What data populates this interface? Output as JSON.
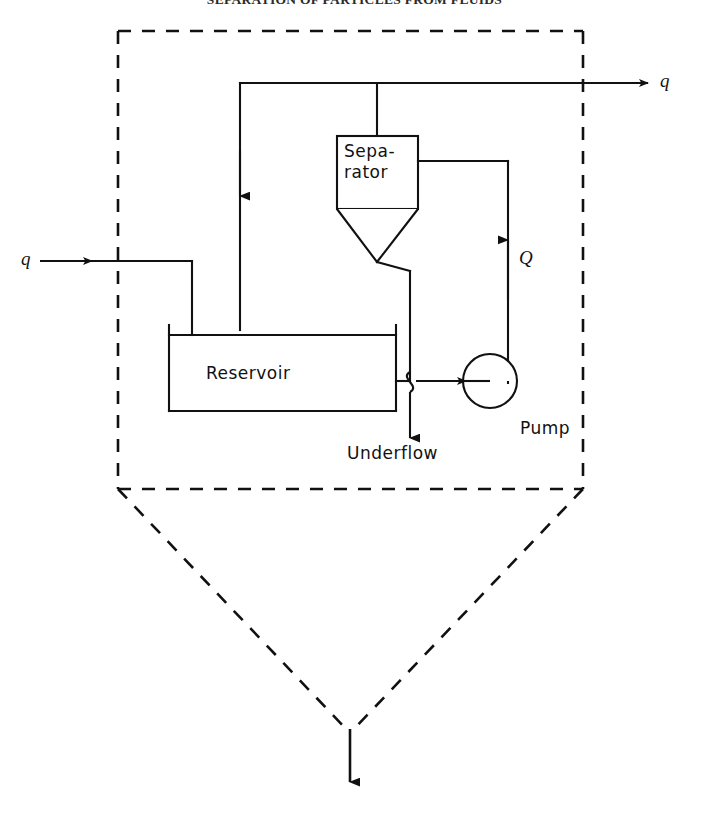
{
  "page": {
    "header_title": "SEPARATION OF PARTICLES FROM FLUIDS",
    "width": 709,
    "height": 820,
    "background": "#ffffff",
    "line_color": "#111111",
    "caption": ""
  },
  "diagram": {
    "type": "process-flow-diagram",
    "units": {
      "separator": {
        "label_line_1": "Sepa-",
        "label_line_2": "rator",
        "shape": "rectangle-with-cone-bottom"
      },
      "reservoir": {
        "label": "Reservoir",
        "shape": "open-top-tank"
      },
      "pump": {
        "label": "Pump",
        "shape": "circle-with-shaft"
      }
    },
    "streams": [
      {
        "name": "feed-inlet",
        "label": "q",
        "direction": "right",
        "style": "solid"
      },
      {
        "name": "overhead-outlet",
        "label": "q",
        "direction": "right",
        "style": "solid"
      },
      {
        "name": "pump-discharge",
        "label": "Q",
        "direction": "up",
        "style": "solid"
      },
      {
        "name": "underflow-outlet",
        "label": "Underflow",
        "direction": "down",
        "style": "solid"
      },
      {
        "name": "net-outlet",
        "label": "",
        "direction": "down",
        "style": "solid"
      }
    ],
    "boundary": {
      "name": "control-volume",
      "style": "dashed",
      "shape": "pentagon-funnel"
    },
    "labels": {
      "separator_line1": "Sepa-",
      "separator_line2": "rator",
      "reservoir": "Reservoir",
      "pump": "Pump",
      "underflow": "Underflow",
      "q_inlet": "q",
      "q_outlet": "q",
      "Q_pump": "Q"
    }
  }
}
